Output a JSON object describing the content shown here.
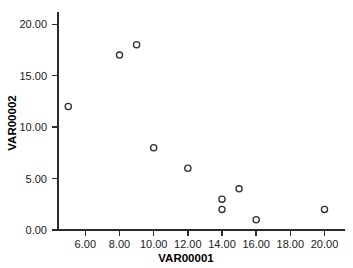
{
  "chart_data": {
    "type": "scatter",
    "title": "",
    "xlabel": "VAR00001",
    "ylabel": "VAR00002",
    "xlim": [
      4.4,
      21.2
    ],
    "ylim": [
      0,
      20.8
    ],
    "grid": false,
    "legend": false,
    "marker": "open-circle",
    "xticks": [
      6,
      8,
      10,
      12,
      14,
      16,
      18,
      20
    ],
    "xticklabels": [
      "6.00",
      "8.00",
      "10.00",
      "12.00",
      "14.00",
      "16.00",
      "18.00",
      "20.00"
    ],
    "yticks": [
      0,
      5,
      10,
      15,
      20
    ],
    "yticklabels": [
      "0.00",
      "5.00",
      "10.00",
      "15.00",
      "20.00"
    ],
    "points": [
      {
        "x": 5,
        "y": 12
      },
      {
        "x": 8,
        "y": 17
      },
      {
        "x": 9,
        "y": 18
      },
      {
        "x": 10,
        "y": 8
      },
      {
        "x": 12,
        "y": 6
      },
      {
        "x": 14,
        "y": 3
      },
      {
        "x": 14,
        "y": 2
      },
      {
        "x": 15,
        "y": 4
      },
      {
        "x": 16,
        "y": 1
      },
      {
        "x": 20,
        "y": 2
      }
    ],
    "colors": {
      "background": "#ffffff",
      "axis": "#2b2b2b",
      "marker_stroke": "#2f2f2f",
      "text": "#1a1a1a"
    }
  }
}
